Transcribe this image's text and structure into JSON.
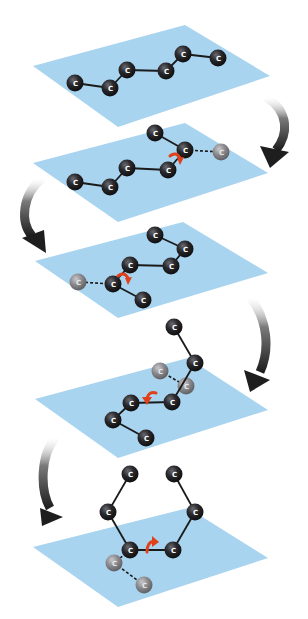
{
  "diagram": {
    "width": 308,
    "height": 619,
    "colors": {
      "plane": "#a8d4f0",
      "atom": "#1c1c1e",
      "atom_highlight": "#6a6a70",
      "ghost_atom": "#8a8a8e",
      "ghost_highlight": "#c8c8cc",
      "bond": "#1a1a1a",
      "rotation_arrow": "#e0401a",
      "step_arrow_dark": "#1e1e1e",
      "step_arrow_light": "#c8c8c8"
    },
    "atom_label": "C",
    "atom_radius": 8.5,
    "steps": [
      {
        "name": "step-1",
        "plane": [
          [
            33,
            66
          ],
          [
            185,
            25
          ],
          [
            270,
            76
          ],
          [
            118,
            127
          ]
        ],
        "atoms": [
          {
            "x": 75,
            "y": 83
          },
          {
            "x": 110,
            "y": 88
          },
          {
            "x": 127,
            "y": 70
          },
          {
            "x": 166,
            "y": 71
          },
          {
            "x": 183,
            "y": 54
          },
          {
            "x": 218,
            "y": 58
          }
        ],
        "ghosts": [],
        "bonds": [
          [
            0,
            1
          ],
          [
            1,
            2
          ],
          [
            2,
            3
          ],
          [
            3,
            4
          ],
          [
            4,
            5
          ]
        ],
        "dashed": [],
        "rotation": null
      },
      {
        "name": "step-2",
        "plane": [
          [
            33,
            163
          ],
          [
            185,
            123
          ],
          [
            268,
            173
          ],
          [
            118,
            222
          ]
        ],
        "atoms": [
          {
            "x": 75,
            "y": 182
          },
          {
            "x": 110,
            "y": 187
          },
          {
            "x": 127,
            "y": 168
          },
          {
            "x": 168,
            "y": 170
          },
          {
            "x": 185,
            "y": 150
          },
          {
            "x": 155,
            "y": 133
          }
        ],
        "ghosts": [
          {
            "x": 221,
            "y": 152
          }
        ],
        "bonds": [
          [
            0,
            1
          ],
          [
            1,
            2
          ],
          [
            2,
            3
          ],
          [
            3,
            4
          ],
          [
            4,
            5
          ]
        ],
        "dashed": [
          [
            4,
            "g0"
          ]
        ],
        "rotation": {
          "x": 176,
          "y": 160,
          "dir": "cw"
        }
      },
      {
        "name": "step-3",
        "plane": [
          [
            35,
            261
          ],
          [
            183,
            222
          ],
          [
            268,
            273
          ],
          [
            118,
            318
          ]
        ],
        "atoms": [
          {
            "x": 155,
            "y": 235
          },
          {
            "x": 185,
            "y": 249
          },
          {
            "x": 171,
            "y": 266
          },
          {
            "x": 130,
            "y": 265
          },
          {
            "x": 113,
            "y": 284
          },
          {
            "x": 143,
            "y": 300
          }
        ],
        "ghosts": [
          {
            "x": 78,
            "y": 282
          }
        ],
        "bonds": [
          [
            0,
            1
          ],
          [
            1,
            2
          ],
          [
            2,
            3
          ],
          [
            3,
            4
          ],
          [
            4,
            5
          ]
        ],
        "dashed": [
          [
            4,
            "g0"
          ]
        ],
        "rotation": {
          "x": 124,
          "y": 280,
          "dir": "cw"
        }
      },
      {
        "name": "step-4",
        "plane": [
          [
            35,
            399
          ],
          [
            188,
            358
          ],
          [
            268,
            410
          ],
          [
            118,
            458
          ]
        ],
        "atoms": [
          {
            "x": 174,
            "y": 327
          },
          {
            "x": 195,
            "y": 363
          },
          {
            "x": 172,
            "y": 402
          },
          {
            "x": 131,
            "y": 403
          },
          {
            "x": 113,
            "y": 420
          },
          {
            "x": 146,
            "y": 438
          }
        ],
        "ghosts": [
          {
            "x": 160,
            "y": 371
          },
          {
            "x": 186,
            "y": 386
          }
        ],
        "bonds": [
          [
            0,
            1
          ],
          [
            1,
            2
          ],
          [
            2,
            3
          ],
          [
            3,
            4
          ],
          [
            4,
            5
          ]
        ],
        "dashed": [
          [
            "g0",
            "g1"
          ]
        ],
        "rotation": {
          "x": 150,
          "y": 398,
          "dir": "ccw"
        }
      },
      {
        "name": "step-5",
        "plane": [
          [
            33,
            547
          ],
          [
            188,
            508
          ],
          [
            268,
            558
          ],
          [
            118,
            607
          ]
        ],
        "atoms": [
          {
            "x": 130,
            "y": 474
          },
          {
            "x": 108,
            "y": 512
          },
          {
            "x": 130,
            "y": 550
          },
          {
            "x": 173,
            "y": 550
          },
          {
            "x": 195,
            "y": 512
          },
          {
            "x": 174,
            "y": 474
          }
        ],
        "ghosts": [
          {
            "x": 114,
            "y": 563
          },
          {
            "x": 144,
            "y": 585
          }
        ],
        "bonds": [
          [
            0,
            1
          ],
          [
            1,
            2
          ],
          [
            2,
            3
          ],
          [
            3,
            4
          ],
          [
            4,
            5
          ]
        ],
        "dashed": [
          [
            2,
            "g0"
          ],
          [
            "g0",
            "g1"
          ]
        ],
        "rotation": {
          "x": 151,
          "y": 544,
          "dir": "up"
        }
      }
    ],
    "step_arrows": [
      {
        "name": "arrow-step-1-to-2",
        "path": "M 266 97 C 290 112, 288 135, 276 150",
        "tip": [
          [
            260,
            146
          ],
          [
            270,
            168
          ],
          [
            289,
            152
          ]
        ]
      },
      {
        "name": "arrow-step-2-to-3",
        "path": "M 42 178 C 22 195, 20 222, 32 236",
        "tip": [
          [
            22,
            238
          ],
          [
            46,
            253
          ],
          [
            44,
            230
          ]
        ]
      },
      {
        "name": "arrow-step-3-to-4",
        "path": "M 250 297 C 268 320, 270 350, 260 372",
        "tip": [
          [
            244,
            370
          ],
          [
            250,
            392
          ],
          [
            270,
            380
          ]
        ]
      },
      {
        "name": "arrow-step-4-to-5",
        "path": "M 56 437 C 40 455, 40 490, 50 508",
        "tip": [
          [
            40,
            508
          ],
          [
            42,
            526
          ],
          [
            63,
            517
          ]
        ]
      }
    ]
  }
}
